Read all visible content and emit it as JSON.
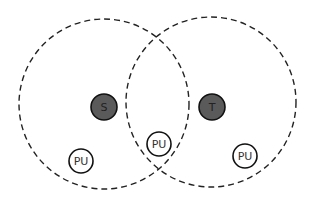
{
  "diagram": {
    "colors": {
      "background": "#ffffff",
      "range_stroke": "#222222",
      "node_dark_fill": "#5a5a5a",
      "node_light_fill": "#ffffff",
      "node_stroke": "#111111"
    },
    "ranges": [
      {
        "name": "source-range",
        "cx": 104,
        "cy": 104,
        "r": 85
      },
      {
        "name": "target-range",
        "cx": 211,
        "cy": 102,
        "r": 85
      }
    ],
    "nodes": [
      {
        "name": "source-node",
        "label": "S",
        "cx": 104,
        "cy": 107,
        "r": 13,
        "type": "dark"
      },
      {
        "name": "target-node",
        "label": "T",
        "cx": 212,
        "cy": 107,
        "r": 13,
        "type": "dark"
      },
      {
        "name": "primary-user-left",
        "label": "PU",
        "cx": 81,
        "cy": 161,
        "r": 12,
        "type": "light"
      },
      {
        "name": "primary-user-middle",
        "label": "PU",
        "cx": 159,
        "cy": 144,
        "r": 12,
        "type": "light"
      },
      {
        "name": "primary-user-right",
        "label": "PU",
        "cx": 245,
        "cy": 156,
        "r": 12,
        "type": "light"
      }
    ]
  }
}
